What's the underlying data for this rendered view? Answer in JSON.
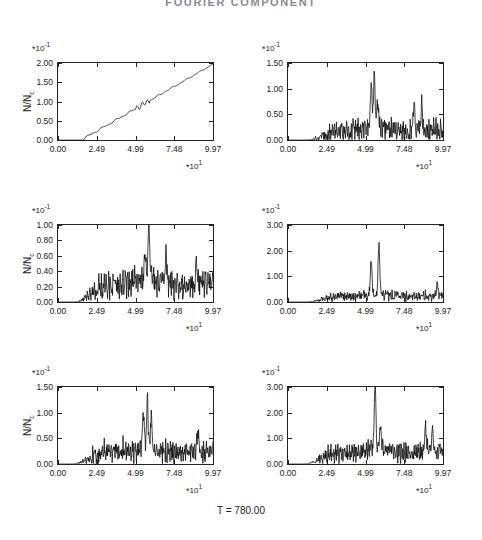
{
  "figure": {
    "title": "FOURIER COMPONENT",
    "footer": "T = 780.00",
    "axis_label_x": "X",
    "axis_label_y_main": "N/N",
    "axis_label_y_sub": "c",
    "x_multiplier_star": "*",
    "x_multiplier_base": "10",
    "x_multiplier_exp": "1",
    "y_multiplier_star": "*",
    "y_multiplier_base": "10",
    "y_multiplier_exp": "-1",
    "line_color": "#111111",
    "axis_color": "#222222"
  },
  "chart_data": [
    {
      "type": "line",
      "panel": "a)",
      "title": "KY = 0",
      "xlabel": "X",
      "ylabel": "N/Nc",
      "xlim": [
        0.0,
        9.97
      ],
      "ylim": [
        0.0,
        2.0
      ],
      "xticks": [
        "0.00",
        "2.49",
        "4.99",
        "7.48",
        "9.97"
      ],
      "xtick_values": [
        0.0,
        2.49,
        4.99,
        7.48,
        9.97
      ],
      "yticks": [
        "0.00",
        "0.50",
        "1.00",
        "1.50",
        "2.00"
      ],
      "ytick_values": [
        0.0,
        0.5,
        1.0,
        1.5,
        2.0
      ],
      "x_multiplier": "*10^1",
      "y_multiplier": "*10^-1",
      "grid": false,
      "legend": "none",
      "shape": "ramp",
      "description": "Monotonic rising ramp from ~0 at x=1.5 to 1.97 at x=9.97 with small ripples",
      "seed": 11,
      "noise": 0.035,
      "baseline_start_x": 1.5,
      "ramp_end_value": 1.97,
      "peaks": []
    },
    {
      "type": "line",
      "panel": "b)",
      "title": "KY = 3",
      "xlabel": "X",
      "ylabel": "N/Nc",
      "xlim": [
        0.0,
        9.97
      ],
      "ylim": [
        0.0,
        1.5
      ],
      "xticks": [
        "0.00",
        "2.49",
        "4.99",
        "7.48",
        "9.97"
      ],
      "xtick_values": [
        0.0,
        2.49,
        4.99,
        7.48,
        9.97
      ],
      "yticks": [
        "0.00",
        "0.50",
        "1.00",
        "1.50"
      ],
      "ytick_values": [
        0.0,
        0.5,
        1.0,
        1.5
      ],
      "x_multiplier": "*10^1",
      "y_multiplier": "*10^-1",
      "grid": false,
      "legend": "none",
      "shape": "noisy-peak",
      "description": "Noisy spectrum, low until x~1.3, rising noise floor, main peak cluster near x=5.6 reaching 1.22, continuing noise to 9.97",
      "seed": 23,
      "noise": 0.17,
      "baseline_start_x": 1.3,
      "floor_level": 0.16,
      "peaks": [
        {
          "x": 5.55,
          "value": 1.22
        },
        {
          "x": 5.35,
          "value": 0.97
        },
        {
          "x": 5.75,
          "value": 0.66
        },
        {
          "x": 8.1,
          "value": 0.62
        },
        {
          "x": 8.6,
          "value": 0.58
        }
      ]
    },
    {
      "type": "line",
      "panel": "c)",
      "title": "KY = 1",
      "xlabel": "X",
      "ylabel": "N/Nc",
      "xlim": [
        0.0,
        9.97
      ],
      "ylim": [
        0.0,
        1.0
      ],
      "xticks": [
        "0.00",
        "2.49",
        "4.99",
        "7.48",
        "9.97"
      ],
      "xtick_values": [
        0.0,
        2.49,
        4.99,
        7.48,
        9.97
      ],
      "yticks": [
        "0.00",
        "0.20",
        "0.40",
        "0.60",
        "0.80",
        "1.00"
      ],
      "ytick_values": [
        0.0,
        0.2,
        0.4,
        0.6,
        0.8,
        1.0
      ],
      "x_multiplier": "*10^1",
      "y_multiplier": "*10^-1",
      "grid": false,
      "legend": "none",
      "shape": "noisy-peak",
      "description": "Noisy spectrum, rises from x~1.1, broad noise floor ~0.2, sharp peak 0.90 near x=5.9, elevated noise after",
      "seed": 37,
      "noise": 0.13,
      "baseline_start_x": 1.1,
      "floor_level": 0.2,
      "peaks": [
        {
          "x": 5.85,
          "value": 0.9
        },
        {
          "x": 5.6,
          "value": 0.52
        },
        {
          "x": 6.95,
          "value": 0.52
        },
        {
          "x": 8.9,
          "value": 0.45
        }
      ]
    },
    {
      "type": "line",
      "panel": "d)",
      "title": "KY = 4",
      "xlabel": "X",
      "ylabel": "N/Nc",
      "xlim": [
        0.0,
        9.97
      ],
      "ylim": [
        0.0,
        3.0
      ],
      "xticks": [
        "0.00",
        "2.49",
        "4.99",
        "7.48",
        "9.97"
      ],
      "xtick_values": [
        0.0,
        2.49,
        4.99,
        7.48,
        9.97
      ],
      "yticks": [
        "0.00",
        "1.00",
        "2.00",
        "3.00"
      ],
      "ytick_values": [
        0.0,
        1.0,
        2.0,
        3.0
      ],
      "x_multiplier": "*10^1",
      "y_multiplier": "*10^-1",
      "grid": false,
      "legend": "none",
      "shape": "noisy-peak",
      "description": "Low noise floor ~0.2, twin sharp peaks: 1.52 at x=5.35 and 2.15 at x=5.85, small noise elsewhere",
      "seed": 51,
      "noise": 0.14,
      "baseline_start_x": 1.2,
      "floor_level": 0.19,
      "peaks": [
        {
          "x": 5.35,
          "value": 1.52
        },
        {
          "x": 5.85,
          "value": 2.15
        },
        {
          "x": 9.6,
          "value": 0.62
        }
      ]
    },
    {
      "type": "line",
      "panel": "e)",
      "title": "KY = 2",
      "xlabel": "X",
      "ylabel": "N/Nc",
      "xlim": [
        0.0,
        9.97
      ],
      "ylim": [
        0.0,
        1.5
      ],
      "xticks": [
        "0.00",
        "2.49",
        "4.99",
        "7.48",
        "9.97"
      ],
      "xtick_values": [
        0.0,
        2.49,
        4.99,
        7.48,
        9.97
      ],
      "yticks": [
        "0.00",
        "0.50",
        "1.00",
        "1.50"
      ],
      "ytick_values": [
        0.0,
        0.5,
        1.0,
        1.5
      ],
      "x_multiplier": "*10^1",
      "y_multiplier": "*10^-1",
      "grid": false,
      "legend": "none",
      "shape": "noisy-peak",
      "description": "Rises from x~1.0, noise floor ~0.2, peak cluster 1.08 near x=5.8, broad noise continuing to edge",
      "seed": 67,
      "noise": 0.17,
      "baseline_start_x": 1.0,
      "floor_level": 0.2,
      "peaks": [
        {
          "x": 5.75,
          "value": 1.08
        },
        {
          "x": 5.5,
          "value": 0.93
        },
        {
          "x": 6.0,
          "value": 0.8
        },
        {
          "x": 9.0,
          "value": 0.6
        }
      ]
    },
    {
      "type": "line",
      "panel": "f)",
      "title": "KY = 5",
      "xlabel": "X",
      "ylabel": "N/Nc",
      "xlim": [
        0.0,
        9.97
      ],
      "ylim": [
        0.0,
        3.0
      ],
      "xticks": [
        "0.00",
        "2.49",
        "4.99",
        "7.48",
        "9.97"
      ],
      "xtick_values": [
        0.0,
        2.49,
        4.99,
        7.48,
        9.97
      ],
      "yticks": [
        "0.00",
        "1.00",
        "2.00",
        "3.00"
      ],
      "ytick_values": [
        0.0,
        1.0,
        2.0,
        3.0
      ],
      "x_multiplier": "*10^1",
      "y_multiplier": "*10^-1",
      "grid": false,
      "legend": "none",
      "shape": "noisy-peak",
      "description": "Noise floor ~0.35 rising, single very sharp peak 2.95 at x=5.6, elevated noise up to 1.3 near x=9",
      "seed": 83,
      "noise": 0.28,
      "baseline_start_x": 1.1,
      "floor_level": 0.38,
      "peaks": [
        {
          "x": 5.6,
          "value": 2.95
        },
        {
          "x": 5.95,
          "value": 1.22
        },
        {
          "x": 8.85,
          "value": 1.32
        },
        {
          "x": 9.3,
          "value": 1.18
        }
      ]
    }
  ]
}
